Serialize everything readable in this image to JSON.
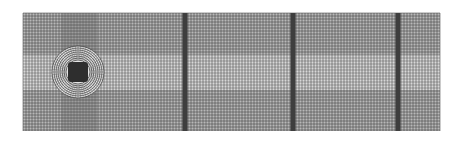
{
  "figure": {
    "type": "structured computational mesh",
    "domain_box": {
      "x": 23,
      "y": 13,
      "width": 417,
      "height": 118
    },
    "background_color": "#ffffff",
    "line_color": "#3a3a3a",
    "grid_spacing_px": 3,
    "refinement_bands_x": [
      185,
      293,
      398
    ],
    "refinement_band_width_px": 5,
    "wake_band": {
      "y_top": 55,
      "y_bottom": 90
    },
    "cylinder": {
      "cx": 78,
      "cy": 72,
      "inner_half_size": 10,
      "ogrid_radius": 26,
      "ring_count": 8
    },
    "vertical_refinement_column": {
      "x_left": 62,
      "x_right": 97
    }
  }
}
